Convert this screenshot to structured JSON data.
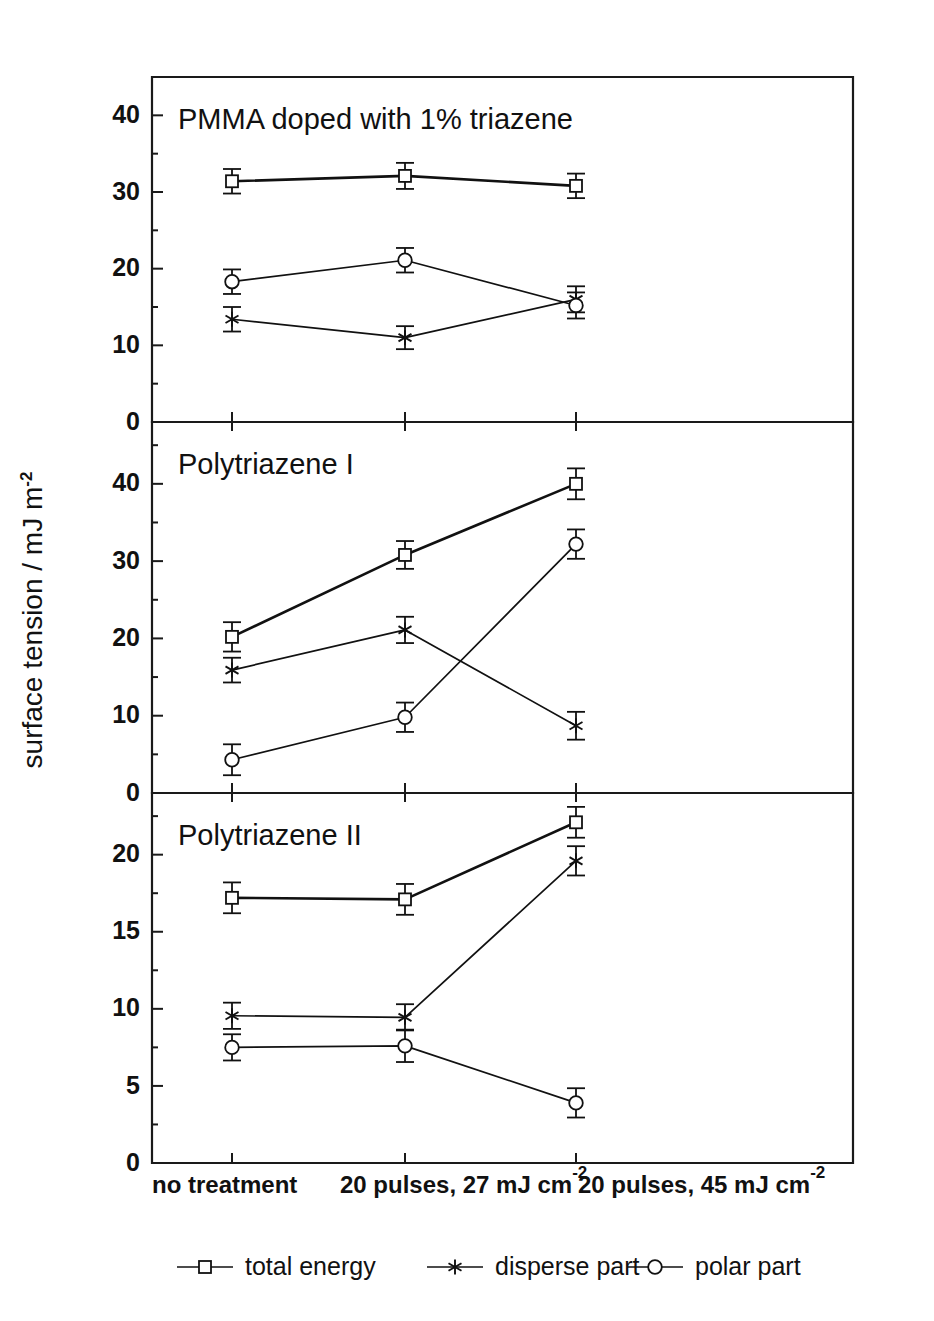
{
  "chart_data": {
    "type": "line",
    "title": "",
    "xlabel": "",
    "ylabel": "surface tension / mJ m",
    "ylabel_sup": "-2",
    "grid": false,
    "legend_position": "bottom",
    "categories": [
      "no treatment",
      "20 pulses, 27 mJ cm",
      "20 pulses, 45 mJ cm"
    ],
    "category_superscripts": [
      "",
      "-2",
      "-2"
    ],
    "legend": [
      {
        "name": "total energy",
        "marker": "square"
      },
      {
        "name": "disperse part",
        "marker": "asterisk"
      },
      {
        "name": "polar part",
        "marker": "circle"
      }
    ],
    "panels": [
      {
        "title": "PMMA doped with 1% triazene",
        "ylim": [
          0,
          45
        ],
        "yticks": [
          0,
          10,
          20,
          30,
          40
        ],
        "series": [
          {
            "name": "total energy",
            "marker": "square",
            "values": [
              31.4,
              32.1,
              30.8
            ],
            "errors": [
              1.6,
              1.7,
              1.6
            ]
          },
          {
            "name": "disperse part",
            "marker": "asterisk",
            "values": [
              13.4,
              11.0,
              16.0
            ],
            "errors": [
              1.6,
              1.5,
              1.7
            ]
          },
          {
            "name": "polar part",
            "marker": "circle",
            "values": [
              18.3,
              21.1,
              15.2
            ],
            "errors": [
              1.6,
              1.6,
              1.7
            ]
          }
        ]
      },
      {
        "title": "Polytriazene I",
        "ylim": [
          0,
          48
        ],
        "yticks": [
          0,
          10,
          20,
          30,
          40
        ],
        "series": [
          {
            "name": "total energy",
            "marker": "square",
            "values": [
              20.2,
              30.8,
              40.0
            ],
            "errors": [
              1.9,
              1.8,
              2.0
            ]
          },
          {
            "name": "disperse part",
            "marker": "asterisk",
            "values": [
              15.9,
              21.1,
              8.7
            ],
            "errors": [
              1.6,
              1.7,
              1.8
            ]
          },
          {
            "name": "polar part",
            "marker": "circle",
            "values": [
              4.3,
              9.8,
              32.2
            ],
            "errors": [
              2.0,
              1.9,
              1.9
            ]
          }
        ]
      },
      {
        "title": "Polytriazene II",
        "ylim": [
          0,
          24
        ],
        "yticks": [
          0,
          5,
          10,
          15,
          20
        ],
        "series": [
          {
            "name": "total energy",
            "marker": "square",
            "values": [
              17.2,
              17.1,
              22.1
            ],
            "errors": [
              1.0,
              1.0,
              1.0
            ]
          },
          {
            "name": "disperse part",
            "marker": "asterisk",
            "values": [
              9.55,
              9.45,
              19.6
            ],
            "errors": [
              0.85,
              0.85,
              0.95
            ]
          },
          {
            "name": "polar part",
            "marker": "circle",
            "values": [
              7.5,
              7.6,
              3.9
            ],
            "errors": [
              0.85,
              1.05,
              0.95
            ]
          }
        ]
      }
    ]
  }
}
